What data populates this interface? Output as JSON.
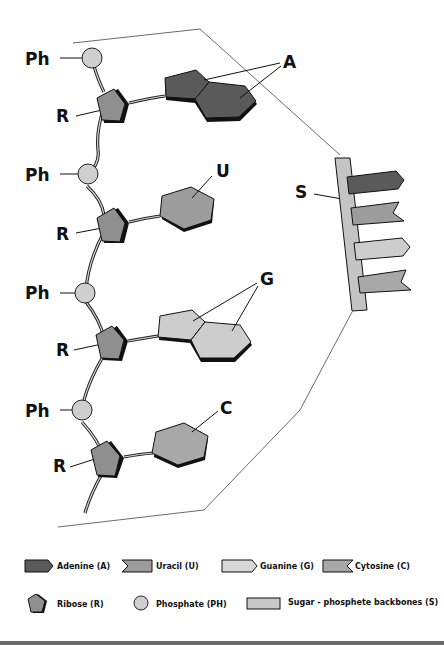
{
  "colors": {
    "adenine": "#5a5a5a",
    "uracil": "#9c9c9c",
    "guanine": "#cdcdcd",
    "cytosine": "#a8a8a8",
    "ribose": "#8f8f8f",
    "phosphate": "#cfcfcf",
    "backbone": "#c4c4c4",
    "outline": "#111111"
  },
  "nucleotides": [
    {
      "phosphate_label": "Ph",
      "ribose_label": "R",
      "base_label": "A",
      "base": "adenine"
    },
    {
      "phosphate_label": "Ph",
      "ribose_label": "R",
      "base_label": "U",
      "base": "uracil"
    },
    {
      "phosphate_label": "Ph",
      "ribose_label": "R",
      "base_label": "G",
      "base": "guanine"
    },
    {
      "phosphate_label": "Ph",
      "ribose_label": "R",
      "base_label": "C",
      "base": "cytosine"
    }
  ],
  "schematic": {
    "backbone_label": "S"
  },
  "legend": {
    "row1": [
      {
        "label": "Adenine (A)"
      },
      {
        "label": "Uracil (U)"
      },
      {
        "label": "Guanine (G)"
      },
      {
        "label": "Cytosine (C)"
      }
    ],
    "row2": [
      {
        "label": "Ribose (R)"
      },
      {
        "label": "Phosphate (PH)"
      },
      {
        "label": "Sugar - phosphete backbones (S)"
      }
    ]
  }
}
